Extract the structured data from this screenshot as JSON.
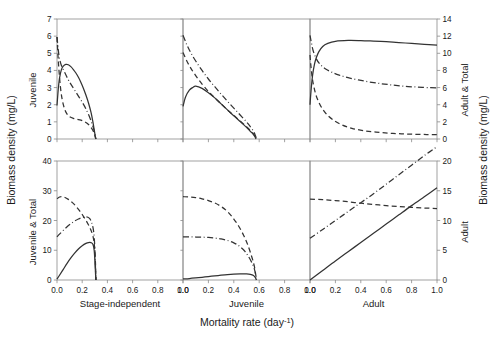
{
  "chart_data": {
    "type": "line",
    "title": "",
    "xlabel": "Mortality rate (day⁻¹)",
    "ylabel_left": "Biomass density (mg/L)",
    "ylabel_right": "Biomass density (mg/L)",
    "layout": {
      "rows": 2,
      "cols": 3,
      "grid": false,
      "legend": "none"
    },
    "series_styles": [
      {
        "name": "solid",
        "dash": "solid"
      },
      {
        "name": "dashed",
        "dash": "dashed"
      },
      {
        "name": "dash-dot",
        "dash": "dashdot"
      }
    ],
    "x_ticks": [
      "0.0",
      "0.2",
      "0.4",
      "0.6",
      "0.8",
      "1.0"
    ],
    "x_tick_values": [
      0.0,
      0.2,
      0.4,
      0.6,
      0.8,
      1.0
    ],
    "xlim": [
      0.0,
      1.0
    ],
    "column_labels": [
      "Stage-independent",
      "Juvenile",
      "Adult"
    ],
    "row_axis_labels_left": [
      "Juvenile",
      "Juvenile & Total"
    ],
    "row_axis_labels_right": [
      "Adult & Total",
      "Adult"
    ],
    "panels": [
      {
        "row": 0,
        "col": 0,
        "column_label": "Stage-independent",
        "y_axis_side": "left",
        "y_axis_label": "Juvenile",
        "ylim": [
          0,
          7
        ],
        "y_ticks": [
          "0",
          "1",
          "2",
          "3",
          "4",
          "5",
          "6",
          "7"
        ],
        "y_tick_values": [
          0,
          1,
          2,
          3,
          4,
          5,
          6,
          7
        ],
        "series": [
          {
            "name": "solid",
            "dash": "solid",
            "x": [
              0.0,
              0.01,
              0.02,
              0.035,
              0.05,
              0.07,
              0.09,
              0.11,
              0.13,
              0.15,
              0.17,
              0.19,
              0.21,
              0.23,
              0.25,
              0.27,
              0.285,
              0.295,
              0.303,
              0.308
            ],
            "y": [
              1.95,
              2.9,
              3.55,
              4.05,
              4.25,
              4.35,
              4.33,
              4.22,
              4.05,
              3.85,
              3.6,
              3.3,
              2.95,
              2.55,
              2.1,
              1.55,
              1.0,
              0.55,
              0.2,
              0.0
            ]
          },
          {
            "name": "dashed",
            "dash": "dashed",
            "x": [
              0.0,
              0.01,
              0.025,
              0.04,
              0.06,
              0.08,
              0.1,
              0.13,
              0.16,
              0.19,
              0.22,
              0.25,
              0.275,
              0.29,
              0.3,
              0.308
            ],
            "y": [
              5.95,
              4.6,
              3.2,
              2.35,
              1.75,
              1.45,
              1.3,
              1.2,
              1.15,
              1.1,
              1.0,
              0.85,
              0.62,
              0.42,
              0.2,
              0.0
            ]
          },
          {
            "name": "dash-dot",
            "dash": "dashdot",
            "x": [
              0.0,
              0.015,
              0.03,
              0.05,
              0.07,
              0.09,
              0.11,
              0.14,
              0.17,
              0.2,
              0.23,
              0.26,
              0.28,
              0.295,
              0.303,
              0.308
            ],
            "y": [
              5.95,
              4.9,
              4.4,
              4.05,
              3.75,
              3.45,
              3.2,
              2.85,
              2.5,
              2.15,
              1.75,
              1.25,
              0.85,
              0.48,
              0.2,
              0.0
            ]
          }
        ]
      },
      {
        "row": 0,
        "col": 1,
        "column_label": "Juvenile",
        "y_axis_side": "none",
        "ylim": [
          0,
          7
        ],
        "series": [
          {
            "name": "solid",
            "dash": "solid",
            "x": [
              0.0,
              0.02,
              0.05,
              0.08,
              0.1,
              0.15,
              0.2,
              0.25,
              0.3,
              0.35,
              0.4,
              0.45,
              0.5,
              0.53,
              0.55,
              0.565,
              0.575
            ],
            "y": [
              1.9,
              2.45,
              2.85,
              3.02,
              3.08,
              2.95,
              2.7,
              2.4,
              2.05,
              1.7,
              1.35,
              1.02,
              0.68,
              0.45,
              0.3,
              0.15,
              0.0
            ]
          },
          {
            "name": "dashed",
            "dash": "dashed",
            "x": [
              0.0,
              0.03,
              0.06,
              0.1,
              0.15,
              0.2,
              0.25,
              0.3,
              0.35,
              0.4,
              0.45,
              0.5,
              0.53,
              0.555,
              0.57,
              0.578
            ],
            "y": [
              5.05,
              4.55,
              4.15,
              3.7,
              3.2,
              2.78,
              2.4,
              2.05,
              1.7,
              1.38,
              1.05,
              0.72,
              0.5,
              0.3,
              0.13,
              0.0
            ]
          },
          {
            "name": "dash-dot",
            "dash": "dashdot",
            "x": [
              0.0,
              0.03,
              0.06,
              0.1,
              0.15,
              0.2,
              0.25,
              0.3,
              0.35,
              0.4,
              0.45,
              0.5,
              0.53,
              0.555,
              0.57,
              0.578
            ],
            "y": [
              6.05,
              5.5,
              5.05,
              4.55,
              4.0,
              3.5,
              3.05,
              2.62,
              2.2,
              1.8,
              1.4,
              1.0,
              0.72,
              0.45,
              0.2,
              0.0
            ]
          }
        ]
      },
      {
        "row": 0,
        "col": 2,
        "column_label": "Adult",
        "y_axis_side": "right",
        "y_axis_label": "Adult & Total",
        "ylim": [
          0,
          14
        ],
        "y_ticks": [
          "0",
          "2",
          "4",
          "6",
          "8",
          "10",
          "12",
          "14"
        ],
        "y_tick_values": [
          0,
          2,
          4,
          6,
          8,
          10,
          12,
          14
        ],
        "series": [
          {
            "name": "solid",
            "dash": "solid",
            "x": [
              0.0,
              0.008,
              0.02,
              0.035,
              0.05,
              0.07,
              0.1,
              0.14,
              0.2,
              0.3,
              0.4,
              0.5,
              0.6,
              0.7,
              0.8,
              0.9,
              1.0
            ],
            "y": [
              4.0,
              5.6,
              7.4,
              8.7,
              9.5,
              10.2,
              10.8,
              11.15,
              11.4,
              11.5,
              11.48,
              11.42,
              11.35,
              11.25,
              11.15,
              11.05,
              10.95
            ]
          },
          {
            "name": "dashed",
            "dash": "dashed",
            "x": [
              0.0,
              0.008,
              0.02,
              0.04,
              0.06,
              0.09,
              0.13,
              0.18,
              0.25,
              0.33,
              0.42,
              0.52,
              0.62,
              0.72,
              0.82,
              0.92,
              1.0
            ],
            "y": [
              9.8,
              8.4,
              6.9,
              5.5,
              4.6,
              3.7,
              2.9,
              2.25,
              1.65,
              1.25,
              0.98,
              0.8,
              0.68,
              0.6,
              0.55,
              0.52,
              0.5
            ]
          },
          {
            "name": "dash-dot",
            "dash": "dashdot",
            "x": [
              0.0,
              0.01,
              0.025,
              0.05,
              0.08,
              0.12,
              0.17,
              0.23,
              0.3,
              0.38,
              0.47,
              0.56,
              0.65,
              0.75,
              0.85,
              0.95,
              1.0
            ],
            "y": [
              12.1,
              11.3,
              10.3,
              9.35,
              8.7,
              8.2,
              7.8,
              7.45,
              7.15,
              6.9,
              6.65,
              6.45,
              6.3,
              6.15,
              6.05,
              5.98,
              5.95
            ]
          }
        ]
      },
      {
        "row": 1,
        "col": 0,
        "column_label": "Stage-independent",
        "y_axis_side": "left",
        "y_axis_label": "Juvenile & Total",
        "ylim": [
          0,
          40
        ],
        "y_ticks": [
          "0",
          "10",
          "20",
          "30",
          "40"
        ],
        "y_tick_values": [
          0,
          10,
          20,
          30,
          40
        ],
        "series": [
          {
            "name": "solid",
            "dash": "solid",
            "x": [
              0.0,
              0.02,
              0.05,
              0.08,
              0.11,
              0.14,
              0.17,
              0.2,
              0.23,
              0.25,
              0.27,
              0.285,
              0.295,
              0.302,
              0.308
            ],
            "y": [
              0.3,
              1.6,
              3.6,
              5.6,
              7.4,
              9.0,
              10.4,
              11.5,
              12.3,
              12.6,
              12.55,
              12.0,
              10.0,
              5.5,
              0.0
            ]
          },
          {
            "name": "dashed",
            "dash": "dashed",
            "x": [
              0.0,
              0.02,
              0.04,
              0.06,
              0.09,
              0.12,
              0.15,
              0.18,
              0.21,
              0.24,
              0.265,
              0.285,
              0.297,
              0.305,
              0.31
            ],
            "y": [
              27.3,
              27.9,
              28.0,
              27.8,
              27.1,
              26.1,
              24.8,
              23.2,
              21.4,
              19.3,
              17.2,
              14.8,
              11.5,
              6.0,
              0.0
            ]
          },
          {
            "name": "dash-dot",
            "dash": "dashdot",
            "x": [
              0.0,
              0.02,
              0.05,
              0.08,
              0.11,
              0.14,
              0.17,
              0.2,
              0.225,
              0.245,
              0.26,
              0.275,
              0.29,
              0.3,
              0.308
            ],
            "y": [
              14.5,
              15.4,
              16.7,
              17.9,
              18.9,
              19.8,
              20.5,
              21.0,
              21.2,
              21.1,
              20.6,
              19.3,
              16.5,
              11.0,
              0.0
            ]
          }
        ]
      },
      {
        "row": 1,
        "col": 1,
        "column_label": "Juvenile",
        "y_axis_side": "none",
        "ylim": [
          0,
          40
        ],
        "series": [
          {
            "name": "solid",
            "dash": "solid",
            "x": [
              0.0,
              0.05,
              0.1,
              0.15,
              0.2,
              0.25,
              0.3,
              0.35,
              0.4,
              0.45,
              0.5,
              0.53,
              0.555,
              0.57,
              0.578
            ],
            "y": [
              0.35,
              0.5,
              0.7,
              0.92,
              1.15,
              1.38,
              1.6,
              1.8,
              1.95,
              2.05,
              2.05,
              1.9,
              1.5,
              0.8,
              0.0
            ]
          },
          {
            "name": "dashed",
            "dash": "dashed",
            "x": [
              0.0,
              0.05,
              0.1,
              0.15,
              0.2,
              0.25,
              0.3,
              0.35,
              0.4,
              0.44,
              0.48,
              0.51,
              0.54,
              0.56,
              0.572,
              0.578
            ],
            "y": [
              28.0,
              27.9,
              27.7,
              27.3,
              26.7,
              25.9,
              24.7,
              23.0,
              20.5,
              18.0,
              14.8,
              11.8,
              8.0,
              5.0,
              2.0,
              0.0
            ]
          },
          {
            "name": "dash-dot",
            "dash": "dashdot",
            "x": [
              0.0,
              0.05,
              0.1,
              0.15,
              0.2,
              0.25,
              0.3,
              0.35,
              0.4,
              0.44,
              0.48,
              0.51,
              0.54,
              0.56,
              0.572,
              0.578
            ],
            "y": [
              14.5,
              14.5,
              14.45,
              14.4,
              14.3,
              14.1,
              13.8,
              13.3,
              12.5,
              11.5,
              10.0,
              8.3,
              6.0,
              4.0,
              1.8,
              0.0
            ]
          }
        ]
      },
      {
        "row": 1,
        "col": 2,
        "column_label": "Adult",
        "y_axis_side": "right",
        "y_axis_label": "Adult",
        "ylim": [
          0,
          20
        ],
        "y_ticks": [
          "0",
          "5",
          "10",
          "15",
          "20"
        ],
        "y_tick_values": [
          0,
          5,
          10,
          15,
          20
        ],
        "series": [
          {
            "name": "solid",
            "dash": "solid",
            "x": [
              0.0,
              0.1,
              0.2,
              0.3,
              0.4,
              0.5,
              0.6,
              0.7,
              0.8,
              0.9,
              1.0
            ],
            "y": [
              0.0,
              1.6,
              3.2,
              4.75,
              6.3,
              7.85,
              9.4,
              10.95,
              12.5,
              14.0,
              15.5
            ]
          },
          {
            "name": "dashed",
            "dash": "dashed",
            "x": [
              0.0,
              0.1,
              0.2,
              0.3,
              0.4,
              0.5,
              0.6,
              0.7,
              0.8,
              0.9,
              1.0
            ],
            "y": [
              13.6,
              13.5,
              13.35,
              13.15,
              12.9,
              12.7,
              12.5,
              12.35,
              12.2,
              12.1,
              12.0
            ]
          },
          {
            "name": "dash-dot",
            "dash": "dashdot",
            "x": [
              0.0,
              0.1,
              0.2,
              0.3,
              0.4,
              0.5,
              0.6,
              0.7,
              0.8,
              0.9,
              1.0
            ],
            "y": [
              7.0,
              8.5,
              10.0,
              11.5,
              13.0,
              14.5,
              16.1,
              17.7,
              19.3,
              20.9,
              22.4
            ]
          }
        ]
      }
    ]
  }
}
